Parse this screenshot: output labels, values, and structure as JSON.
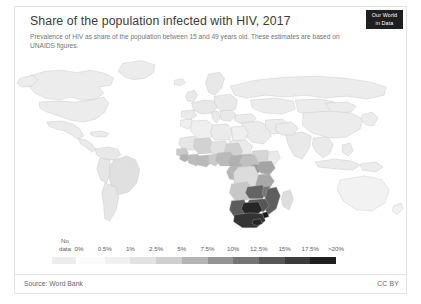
{
  "header": {
    "title": "Share of the population infected with HIV, 2017",
    "subtitle": "Prevalence of HIV as share of the population between 15 and 49 years old. These estimates are based on UNAIDS figures."
  },
  "logo": {
    "line1": "Our World",
    "line2": "in Data"
  },
  "legend": {
    "no_data_line1": "No",
    "no_data_line2": "data",
    "ticks": [
      "0%",
      "0.5%",
      "1%",
      "2.5%",
      "5%",
      "7.5%",
      "10%",
      "12.5%",
      "15%",
      "17.5%",
      ">20%"
    ],
    "no_data_color": "#ececec",
    "colors": [
      "#fbfbfb",
      "#f0f0f0",
      "#e2e2e2",
      "#cfcfcf",
      "#b4b4b4",
      "#949494",
      "#757575",
      "#575757",
      "#3b3b3b",
      "#1f1f1f"
    ]
  },
  "footer": {
    "source": "Source: Word Bank",
    "license": "CC BY"
  },
  "chart_data": {
    "type": "heatmap",
    "title": "Share of the population infected with HIV, 2017",
    "subtitle": "Prevalence of HIV as share of the population between 15 and 49 years old. These estimates are based on UNAIDS figures.",
    "unit": "% of population aged 15-49",
    "year": 2017,
    "projection": "world-choropleth",
    "legend_position": "bottom",
    "bins": [
      "0%",
      "0.5%",
      "1%",
      "2.5%",
      "5%",
      "7.5%",
      "10%",
      "12.5%",
      "15%",
      "17.5%",
      ">20%"
    ],
    "no_data_label": "No data",
    "regions": [
      {
        "name": "Eswatini",
        "value": 27.4,
        "shade": "#1a1a1a"
      },
      {
        "name": "Lesotho",
        "value": 23.8,
        "shade": "#242424"
      },
      {
        "name": "Botswana",
        "value": 22.8,
        "shade": "#262626"
      },
      {
        "name": "South Africa",
        "value": 18.8,
        "shade": "#343434"
      },
      {
        "name": "Zimbabwe",
        "value": 13.3,
        "shade": "#565656"
      },
      {
        "name": "Namibia",
        "value": 12.6,
        "shade": "#5c5c5c"
      },
      {
        "name": "Zambia",
        "value": 11.5,
        "shade": "#646464"
      },
      {
        "name": "Mozambique",
        "value": 12.5,
        "shade": "#5e5e5e"
      },
      {
        "name": "Malawi",
        "value": 9.6,
        "shade": "#767676"
      },
      {
        "name": "Equatorial Guinea",
        "value": 6.5,
        "shade": "#8f8f8f"
      },
      {
        "name": "Tanzania",
        "value": 4.5,
        "shade": "#a8a8a8"
      },
      {
        "name": "Uganda",
        "value": 5.9,
        "shade": "#989898"
      },
      {
        "name": "Kenya",
        "value": 4.8,
        "shade": "#a4a4a4"
      },
      {
        "name": "Central African Republic",
        "value": 3.6,
        "shade": "#b0b0b0"
      },
      {
        "name": "Gabon",
        "value": 3.6,
        "shade": "#b0b0b0"
      },
      {
        "name": "Cameroon",
        "value": 3.6,
        "shade": "#b0b0b0"
      },
      {
        "name": "Congo",
        "value": 3.1,
        "shade": "#b6b6b6"
      },
      {
        "name": "Angola",
        "value": 1.9,
        "shade": "#c7c7c7"
      },
      {
        "name": "Rwanda",
        "value": 2.7,
        "shade": "#bcbcbc"
      },
      {
        "name": "Burundi",
        "value": 1.0,
        "shade": "#d4d4d4"
      },
      {
        "name": "Nigeria",
        "value": 2.8,
        "shade": "#bababa"
      },
      {
        "name": "Ivory Coast",
        "value": 2.8,
        "shade": "#bababa"
      },
      {
        "name": "Guinea-Bissau",
        "value": 3.4,
        "shade": "#b2b2b2"
      },
      {
        "name": "Ghana",
        "value": 1.7,
        "shade": "#cacaca"
      },
      {
        "name": "Togo",
        "value": 2.1,
        "shade": "#c4c4c4"
      },
      {
        "name": "Chad",
        "value": 1.3,
        "shade": "#d0d0d0"
      },
      {
        "name": "South Sudan",
        "value": 2.4,
        "shade": "#c0c0c0"
      },
      {
        "name": "Democratic Republic of Congo",
        "value": 0.7,
        "shade": "#dcdcdc"
      },
      {
        "name": "Ethiopia",
        "value": 1.0,
        "shade": "#d6d6d6"
      },
      {
        "name": "Mali",
        "value": 1.2,
        "shade": "#d2d2d2"
      },
      {
        "name": "Sudan",
        "value": 0.2,
        "shade": "#eaeaea"
      },
      {
        "name": "Algeria",
        "value": 0.1,
        "shade": "#efefef"
      },
      {
        "name": "Egypt",
        "value": 0.1,
        "shade": "#efefef"
      },
      {
        "name": "Morocco",
        "value": 0.1,
        "shade": "#efefef"
      },
      {
        "name": "Libya",
        "value": 0.2,
        "shade": "#ebebeb"
      },
      {
        "name": "Brazil",
        "value": 0.6,
        "shade": "#e0e0e0"
      },
      {
        "name": "Argentina",
        "value": 0.4,
        "shade": "#e6e6e6"
      },
      {
        "name": "Europe",
        "value": 0.3,
        "shade": "#e8e8e8"
      },
      {
        "name": "Russia",
        "value": null,
        "shade": "#ececec"
      },
      {
        "name": "China",
        "value": null,
        "shade": "#ececec"
      },
      {
        "name": "United States",
        "value": null,
        "shade": "#ececec"
      },
      {
        "name": "Canada",
        "value": null,
        "shade": "#ececec"
      },
      {
        "name": "Australia",
        "value": 0.1,
        "shade": "#f2f2f2"
      }
    ]
  }
}
